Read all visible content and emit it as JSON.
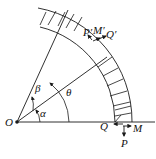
{
  "diagram": {
    "title": "",
    "colors": {
      "stroke": "#1a1a1a",
      "background": "#ffffff"
    },
    "labels": {
      "origin": "O",
      "alpha": "α",
      "beta": "β",
      "theta": "θ",
      "P_prime": "P′",
      "M_prime": "M′",
      "Q_prime": "Q′",
      "Q": "Q",
      "M": "M",
      "P": "P"
    },
    "elements": [
      "origin point O",
      "horizontal baseline from O",
      "inner circular arc (radius ~98)",
      "outer circular arc (radius ~115)",
      "hatched annular sector near baseline",
      "hatched annular sector at top",
      "radial line at angle alpha",
      "radial line at angle alpha+beta",
      "angle arcs alpha, beta, theta",
      "force/moment arrows P, Q, M at lower section",
      "force/moment arrows P', Q', M' at upper section"
    ]
  }
}
